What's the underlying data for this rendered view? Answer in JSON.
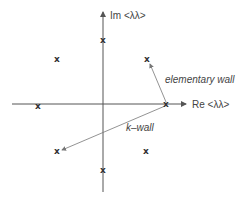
{
  "diagram": {
    "axes": {
      "x_label": "Re <λλ>",
      "y_label": "Im <λλ>"
    },
    "points": [
      {
        "name": "top",
        "glyph": "x",
        "x": 103,
        "y": 40
      },
      {
        "name": "upper-left",
        "glyph": "x",
        "x": 57,
        "y": 59
      },
      {
        "name": "upper-right",
        "glyph": "x",
        "x": 147,
        "y": 59
      },
      {
        "name": "left",
        "glyph": "x",
        "x": 38,
        "y": 106
      },
      {
        "name": "right-on-axis",
        "glyph": "x",
        "x": 166,
        "y": 104
      },
      {
        "name": "lower-left",
        "glyph": "x",
        "x": 57,
        "y": 151
      },
      {
        "name": "lower-right",
        "glyph": "x",
        "x": 146,
        "y": 151
      },
      {
        "name": "bottom",
        "glyph": "x",
        "x": 103,
        "y": 170
      }
    ],
    "annotations": {
      "elementary_wall": "elementary wall",
      "k_wall": "k–wall"
    },
    "colors": {
      "axis": "#555555",
      "arrow": "#777777",
      "text": "#444444"
    }
  }
}
